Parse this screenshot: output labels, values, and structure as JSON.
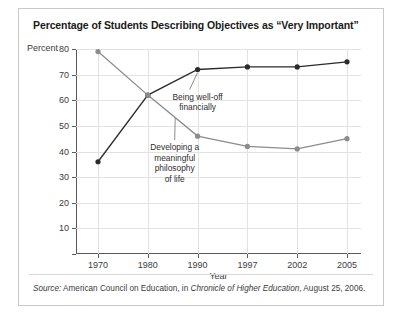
{
  "figure": {
    "title": "Percentage of Students Describing Objectives as “Very Important”",
    "y_axis_title": "Percent",
    "x_axis_title": "Year",
    "source_prefix": "Source:",
    "source_text_1": " American Council on Education, in ",
    "source_italic": "Chronicle of Higher Education",
    "source_text_2": ", August 25, 2006."
  },
  "annotations": {
    "well_off": "Being well-off\nfinancially",
    "philosophy": "Developing a\nmeaningful\nphilosophy\nof life"
  },
  "colors": {
    "series_well_off": "#2b2b2b",
    "series_philosophy": "#8c8c8c",
    "gridline": "#e2e2e2",
    "axis": "#5a5a5a",
    "frame": "#c9c9c9"
  },
  "chart_data": {
    "type": "line",
    "title": "Percentage of Students Describing Objectives as “Very Important”",
    "xlabel": "Year",
    "ylabel": "Percent",
    "categories": [
      "1970",
      "1980",
      "1990",
      "1997",
      "2002",
      "2005"
    ],
    "ylim": [
      0,
      80
    ],
    "yticks": [
      0,
      10,
      20,
      30,
      40,
      50,
      60,
      70,
      80
    ],
    "ytick_labels": [
      "",
      "10",
      "20",
      "30",
      "40",
      "50",
      "60",
      "70",
      "80"
    ],
    "grid": true,
    "legend": "inline-annotations",
    "series": [
      {
        "name": "Being well-off financially",
        "color": "#2b2b2b",
        "marker": "circle",
        "values": [
          36,
          62,
          72,
          73,
          73,
          75
        ]
      },
      {
        "name": "Developing a meaningful philosophy of life",
        "color": "#8c8c8c",
        "marker": "circle",
        "values": [
          79,
          62,
          46,
          42,
          41,
          45
        ]
      }
    ]
  }
}
